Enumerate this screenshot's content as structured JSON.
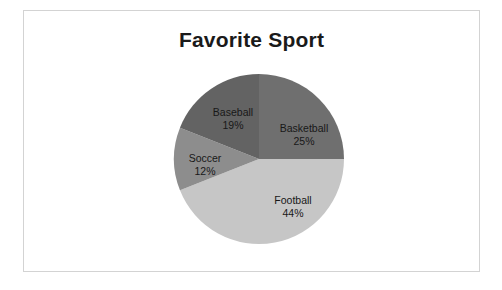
{
  "chart_data": {
    "type": "pie",
    "title": "Favorite Sport",
    "xlabel": "",
    "ylabel": "",
    "legend": "none",
    "grid": false,
    "labels_on_slices": true,
    "start_angle_deg": 0,
    "direction": "clockwise",
    "categories": [
      "Basketball",
      "Football",
      "Soccer",
      "Baseball"
    ],
    "values": [
      25,
      44,
      12,
      19
    ],
    "units": "percent",
    "total": 100,
    "slices": [
      {
        "name": "Basketball",
        "value": 25,
        "value_label": "25%",
        "color": "#6f6f6f",
        "start_deg": 0,
        "end_deg": 90
      },
      {
        "name": "Football",
        "value": 44,
        "value_label": "44%",
        "color": "#c6c6c6",
        "start_deg": 90,
        "end_deg": 248.4
      },
      {
        "name": "Soccer",
        "value": 12,
        "value_label": "12%",
        "color": "#8d8d8d",
        "start_deg": 248.4,
        "end_deg": 291.6
      },
      {
        "name": "Baseball",
        "value": 19,
        "value_label": "19%",
        "color": "#636363",
        "start_deg": 291.6,
        "end_deg": 360
      }
    ]
  },
  "frame": {
    "border_color": "#d3d3d3",
    "background": "#ffffff"
  }
}
